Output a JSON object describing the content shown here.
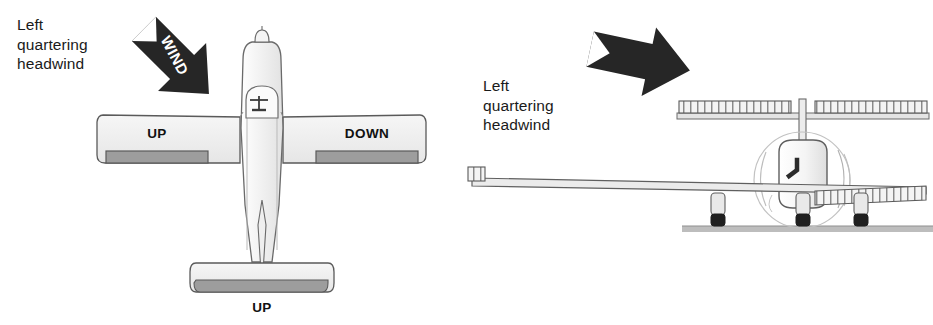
{
  "figure": {
    "background_color": "#ffffff"
  },
  "panels": [
    {
      "id": "top-view",
      "view": "top-down",
      "caption": "Left\nquartering\nheadwind",
      "wind": {
        "label": "WIND",
        "direction": "down-right",
        "angle_deg": 45,
        "color": "#262626"
      },
      "control_labels": {
        "left_aileron": "UP",
        "right_aileron": "DOWN",
        "elevator": "UP"
      },
      "colors": {
        "surface_fill": "#f0f0f0",
        "control_fill": "#9a9a9a",
        "outline": "#4a4a4a"
      }
    },
    {
      "id": "front-view",
      "view": "front",
      "caption": "Left\nquartering\nheadwind",
      "wind": {
        "label": "",
        "direction": "right",
        "angle_deg": 10,
        "color": "#262626"
      },
      "colors": {
        "surface_fill": "#f2f2f2",
        "outline": "#555555",
        "ground": "#b5b5b5",
        "tire": "#1f1f1f"
      }
    }
  ],
  "icons": {
    "wind_arrow": "wind-arrow-icon",
    "control_yoke": "control-yoke-icon",
    "propeller": "propeller-icon",
    "landing_gear": "landing-gear-icon"
  }
}
